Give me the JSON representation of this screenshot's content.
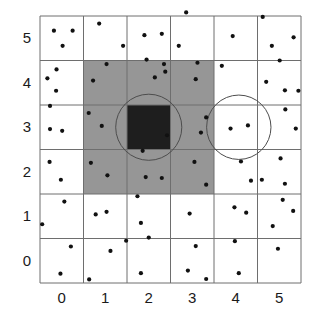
{
  "figure": {
    "title": "",
    "kind": "grid-scatter-diagram",
    "colors": {
      "background": "#ffffff",
      "grid_line": "#6e6e6e",
      "cell_empty": "#ffffff",
      "cell_shaded": "#969696",
      "cell_dark": "#1e1e1e",
      "point": "#111111",
      "circle_stroke": "#4d4d4d",
      "tick_text": "#1a1a1a"
    },
    "plot_area": {
      "x": 40,
      "y": 16,
      "width": 261,
      "height": 267
    },
    "grid": {
      "cols": 6,
      "rows": 6,
      "cell_w": 43.5,
      "cell_h": 44.5
    }
  },
  "chart_data": {
    "type": "scatter",
    "title": "",
    "xlabel": "",
    "ylabel": "",
    "xlim": [
      -0.5,
      5.5
    ],
    "ylim": [
      -0.5,
      5.5
    ],
    "grid": true,
    "legend": null,
    "x_tick_labels": [
      "0",
      "1",
      "2",
      "3",
      "4",
      "5"
    ],
    "y_tick_labels": [
      "0",
      "1",
      "2",
      "3",
      "4",
      "5"
    ],
    "x_ticks": [
      0,
      1,
      2,
      3,
      4,
      5
    ],
    "y_ticks": [
      0,
      1,
      2,
      3,
      4,
      5
    ],
    "cells": {
      "shaded_block": {
        "fill": "#969696",
        "x_range": [
          0.5,
          3.5
        ],
        "y_range": [
          1.5,
          4.5
        ],
        "note": "3x3 block of cells centred on (2,3)"
      },
      "dark_cell": {
        "fill": "#1e1e1e",
        "x_range": [
          1.5,
          2.5
        ],
        "y_range": [
          2.5,
          3.5
        ],
        "note": "centre cell (2,3)"
      }
    },
    "circles": [
      {
        "name": "circle-left",
        "cx": 2.0,
        "cy": 3.0,
        "r": 0.76
      },
      {
        "name": "circle-right",
        "cx": 4.07,
        "cy": 3.0,
        "r": 0.74
      }
    ],
    "points": [
      [
        -0.18,
        5.17
      ],
      [
        0.25,
        5.17
      ],
      [
        0.02,
        4.83
      ],
      [
        0.86,
        5.33
      ],
      [
        1.41,
        4.83
      ],
      [
        1.9,
        5.07
      ],
      [
        2.3,
        5.1
      ],
      [
        2.86,
        5.58
      ],
      [
        2.69,
        4.83
      ],
      [
        3.93,
        5.05
      ],
      [
        4.62,
        5.48
      ],
      [
        4.83,
        4.83
      ],
      [
        5.33,
        5.02
      ],
      [
        -0.12,
        4.3
      ],
      [
        -0.33,
        4.1
      ],
      [
        -0.13,
        3.82
      ],
      [
        1.03,
        4.42
      ],
      [
        0.72,
        4.05
      ],
      [
        1.95,
        4.52
      ],
      [
        2.14,
        4.12
      ],
      [
        2.35,
        4.42
      ],
      [
        2.38,
        4.25
      ],
      [
        3.12,
        4.45
      ],
      [
        3.08,
        4.08
      ],
      [
        3.68,
        4.38
      ],
      [
        5.01,
        4.5
      ],
      [
        4.7,
        4.02
      ],
      [
        5.13,
        3.83
      ],
      [
        5.44,
        3.82
      ],
      [
        -0.27,
        3.48
      ],
      [
        -0.27,
        2.96
      ],
      [
        0.01,
        2.92
      ],
      [
        0.62,
        3.32
      ],
      [
        0.92,
        3.03
      ],
      [
        2.42,
        2.82
      ],
      [
        3.32,
        3.22
      ],
      [
        3.2,
        2.88
      ],
      [
        3.88,
        2.97
      ],
      [
        4.28,
        3.04
      ],
      [
        5.14,
        3.4
      ],
      [
        5.38,
        2.97
      ],
      [
        -0.28,
        2.22
      ],
      [
        -0.02,
        1.82
      ],
      [
        0.67,
        2.2
      ],
      [
        1.05,
        1.92
      ],
      [
        1.86,
        2.47
      ],
      [
        1.93,
        1.88
      ],
      [
        2.3,
        1.86
      ],
      [
        3.05,
        2.22
      ],
      [
        3.32,
        1.71
      ],
      [
        4.12,
        2.23
      ],
      [
        4.35,
        1.8
      ],
      [
        4.6,
        1.82
      ],
      [
        5.03,
        2.3
      ],
      [
        5.13,
        1.73
      ],
      [
        0.06,
        1.33
      ],
      [
        -0.45,
        0.82
      ],
      [
        0.78,
        1.04
      ],
      [
        1.03,
        1.1
      ],
      [
        1.74,
        1.45
      ],
      [
        1.82,
        0.85
      ],
      [
        2.94,
        1.06
      ],
      [
        3.97,
        1.2
      ],
      [
        4.24,
        1.08
      ],
      [
        5.08,
        1.37
      ],
      [
        5.32,
        1.12
      ],
      [
        4.85,
        0.78
      ],
      [
        1.48,
        0.45
      ],
      [
        2.0,
        0.52
      ],
      [
        0.21,
        0.32
      ],
      [
        1.12,
        0.22
      ],
      [
        3.08,
        0.33
      ],
      [
        3.98,
        0.44
      ],
      [
        4.97,
        0.27
      ],
      [
        -0.03,
        -0.29
      ],
      [
        0.63,
        -0.42
      ],
      [
        1.82,
        -0.28
      ],
      [
        2.9,
        -0.22
      ],
      [
        3.32,
        -0.41
      ],
      [
        4.07,
        -0.28
      ]
    ]
  },
  "accessibility": {
    "description": "Square grid of 6 by 6 cells with scattered black points; a 3 by 3 neighbourhood is shaded grey with the centre cell filled black, and two circles are drawn over the grid."
  }
}
